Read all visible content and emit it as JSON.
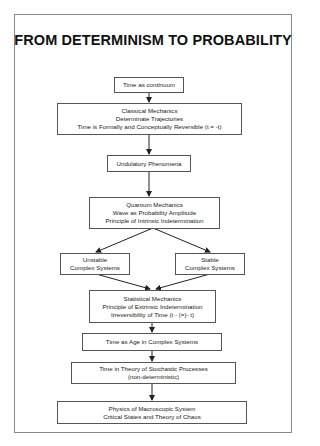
{
  "title": "FROM DETERMINISM TO PROBABILITY",
  "nodes": {
    "continuum": {
      "prefix": "Time as ",
      "emph": "continuum"
    },
    "classical": {
      "line1": "Classical Mechanics",
      "line2": "Determinate Trajectories",
      "line3": "Time is Formally and Conceptually Reversible (t = -t)"
    },
    "undulatory": {
      "line1": "Undulatory Phenomena"
    },
    "quantum": {
      "line1": "Quantum Mechanics",
      "line2": "Wave as Probability Amplitude",
      "line3": "Principle of Intrinsic Indetermination"
    },
    "unstable": {
      "line1": "Unstable",
      "line2": "Complex Systems"
    },
    "stable": {
      "line1": "Stable",
      "line2": "Complex Systems"
    },
    "statistical": {
      "line1": "Statistical Mechanics",
      "line2": "Principle of Extrinsic Indetermination",
      "line3": "Irreversibility of Time (t - (=)- t)"
    },
    "age": {
      "line1": "Time as Age in Complex Systems"
    },
    "stochastic": {
      "line1": "Time in Theory of Stochastic Processes",
      "line2": "(non-deterministic)"
    },
    "macroscopic": {
      "line1": "Physics of Macroscopic System",
      "line2": "Critical States and Theory of Chaos"
    }
  },
  "colors": {
    "border": "#555555",
    "frame": "#8a8a8a",
    "text": "#222222",
    "arrow": "#222222"
  }
}
